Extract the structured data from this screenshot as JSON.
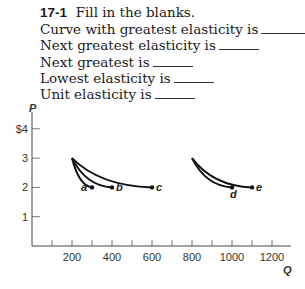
{
  "question": {
    "number": "17-1",
    "instruction": "Fill in the blanks.",
    "lines": [
      "Curve with greatest elasticity is",
      "Next greatest elasticity is",
      "Next greatest is",
      "Lowest elasticity is",
      "Unit elasticity is"
    ]
  },
  "chart_data": {
    "type": "line",
    "title": "",
    "xlabel": "Q",
    "ylabel": "P",
    "xlim": [
      0,
      1250
    ],
    "ylim": [
      0,
      4.5
    ],
    "x_ticks": [
      100,
      200,
      300,
      400,
      500,
      600,
      700,
      800,
      900,
      1000,
      1100,
      1200
    ],
    "x_tick_labels": [
      "200",
      "400",
      "600",
      "800",
      "1000",
      "1200"
    ],
    "y_ticks": [
      1,
      2,
      3,
      4
    ],
    "y_tick_labels": [
      "1",
      "2",
      "3",
      "$4"
    ],
    "grid": false,
    "series": [
      {
        "name": "a",
        "points": [
          [
            200,
            3
          ],
          [
            300,
            2
          ]
        ]
      },
      {
        "name": "b",
        "points": [
          [
            200,
            3
          ],
          [
            400,
            2
          ]
        ]
      },
      {
        "name": "c",
        "points": [
          [
            200,
            3
          ],
          [
            600,
            2
          ]
        ]
      },
      {
        "name": "d",
        "points": [
          [
            800,
            3
          ],
          [
            1000,
            2
          ]
        ]
      },
      {
        "name": "e",
        "points": [
          [
            800,
            3
          ],
          [
            1100,
            2
          ]
        ]
      }
    ]
  }
}
